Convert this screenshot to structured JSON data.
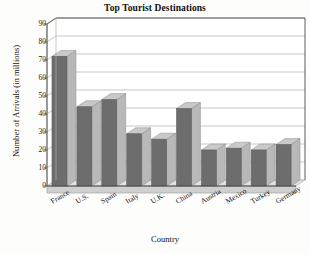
{
  "chart_data": {
    "type": "bar",
    "title": "Top Tourist Destinations",
    "xlabel": "Country",
    "ylabel": "Number of Arrivals (in millions)",
    "categories": [
      "France",
      "U.S.",
      "Spain",
      "Italy",
      "U.K.",
      "China",
      "Austria",
      "Mexico",
      "Turkey",
      "Germany"
    ],
    "values": [
      72,
      44,
      48,
      29,
      26,
      43,
      20,
      21,
      20,
      23
    ],
    "ylim": [
      0,
      90
    ],
    "yticks": [
      0,
      10,
      20,
      30,
      40,
      50,
      60,
      70,
      80,
      90
    ],
    "ytick_labels": [
      "0",
      "10",
      "20",
      "30",
      "40",
      "50",
      "60",
      "70",
      "80",
      "90"
    ],
    "grid": true,
    "legend": "none",
    "style": "3d-column",
    "bar_color": "#6d6d6d",
    "bar_top_color": "#c9c9c9",
    "bar_side_color": "#b8b8b8",
    "grid_color": "#b0b0b0",
    "axis_color": "#4a4a4a",
    "plot_background": "#ffffff"
  }
}
